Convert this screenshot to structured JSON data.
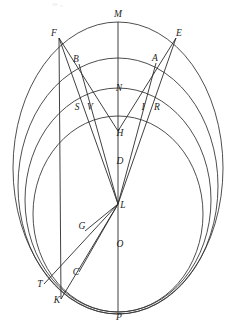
{
  "figure": {
    "kind": "geometric-construction",
    "canvas": {
      "width": 234,
      "height": 325
    },
    "background_color": "#ffffff",
    "curve_color": "#3a3a3a",
    "line_color": "#2b2b2b",
    "label_color": "#1d1d1d",
    "axis": {
      "name": "vertical-axis",
      "x": 118,
      "y_top": 22,
      "y_bottom": 312
    },
    "circles": [
      {
        "id": "circle-outer",
        "cx": 118,
        "cy": 168,
        "rx": 105,
        "ry": 146
      },
      {
        "id": "circle-second",
        "cx": 118,
        "cy": 186,
        "rx": 100,
        "ry": 128
      },
      {
        "id": "circle-third",
        "cx": 118,
        "cy": 200,
        "rx": 93,
        "ry": 112
      },
      {
        "id": "circle-inner",
        "cx": 118,
        "cy": 214,
        "rx": 85,
        "ry": 98
      }
    ],
    "points": [
      {
        "label": "M",
        "x": 118,
        "y": 15,
        "lx": 118,
        "ly": 17,
        "role": "top-vertex-on-axis"
      },
      {
        "label": "F",
        "x": 59,
        "y": 38,
        "lx": 54,
        "ly": 36,
        "role": "upper-left-node"
      },
      {
        "label": "E",
        "x": 176,
        "y": 38,
        "lx": 179,
        "ly": 36,
        "role": "upper-right-node"
      },
      {
        "label": "B",
        "x": 79,
        "y": 64,
        "lx": 76,
        "ly": 62,
        "role": "left-intersection-second-circle"
      },
      {
        "label": "A",
        "x": 156,
        "y": 63,
        "lx": 155,
        "ly": 61,
        "role": "right-intersection-second-circle"
      },
      {
        "label": "N",
        "x": 118,
        "y": 93,
        "lx": 119,
        "ly": 91,
        "role": "axis-point-third-circle"
      },
      {
        "label": "S",
        "x": 78,
        "y": 108,
        "lx": 77,
        "ly": 110,
        "role": "left-intersection-third-circle"
      },
      {
        "label": "V",
        "x": 90,
        "y": 108,
        "lx": 90,
        "ly": 110,
        "role": "left-inner-intersection"
      },
      {
        "label": "I",
        "x": 144,
        "y": 108,
        "lx": 143,
        "ly": 110,
        "role": "right-inner-intersection"
      },
      {
        "label": "R",
        "x": 157,
        "y": 108,
        "lx": 157,
        "ly": 110,
        "role": "right-intersection-third-circle"
      },
      {
        "label": "H",
        "x": 118,
        "y": 131,
        "lx": 120,
        "ly": 136,
        "role": "upper-convergence-on-axis"
      },
      {
        "label": "D",
        "x": 118,
        "y": 160,
        "lx": 120,
        "ly": 164,
        "role": "axis-point-between-H-and-L"
      },
      {
        "label": "L",
        "x": 118,
        "y": 204,
        "lx": 123,
        "ly": 208,
        "role": "main-convergence-node"
      },
      {
        "label": "G",
        "x": 85,
        "y": 231,
        "lx": 82,
        "ly": 229,
        "role": "lower-left-intersection-inner-circle"
      },
      {
        "label": "O",
        "x": 118,
        "y": 243,
        "lx": 120,
        "ly": 247,
        "role": "axis-point-inner-circle-bottom"
      },
      {
        "label": "C",
        "x": 79,
        "y": 272,
        "lx": 76,
        "ly": 275,
        "role": "lower-left-intersection-third-circle"
      },
      {
        "label": "T",
        "x": 44,
        "y": 284,
        "lx": 40,
        "ly": 287,
        "role": "lower-left-terminus-outer"
      },
      {
        "label": "K",
        "x": 61,
        "y": 299,
        "lx": 57,
        "ly": 303,
        "role": "lower-left-terminus-bottom"
      },
      {
        "label": "P",
        "x": 118,
        "y": 311,
        "lx": 119,
        "ly": 320,
        "role": "bottom-vertex-on-axis"
      }
    ],
    "segments": [
      {
        "id": "seg-F-H",
        "from": "F",
        "to": "H"
      },
      {
        "id": "seg-F-L",
        "from": "F",
        "to": "L"
      },
      {
        "id": "seg-F-K",
        "from": "F",
        "to": "K"
      },
      {
        "id": "seg-E-H",
        "from": "E",
        "to": "H"
      },
      {
        "id": "seg-E-L",
        "from": "E",
        "to": "L"
      },
      {
        "id": "seg-A-L",
        "from": "A",
        "to": "L"
      },
      {
        "id": "seg-B-L",
        "from": "B",
        "to": "L"
      },
      {
        "id": "seg-L-T",
        "from": "L",
        "to": "T"
      },
      {
        "id": "seg-L-K",
        "from": "L",
        "to": "K"
      },
      {
        "id": "seg-L-C",
        "from": "L",
        "to": "C"
      },
      {
        "id": "seg-L-G",
        "from": "L",
        "to": "G"
      }
    ]
  }
}
